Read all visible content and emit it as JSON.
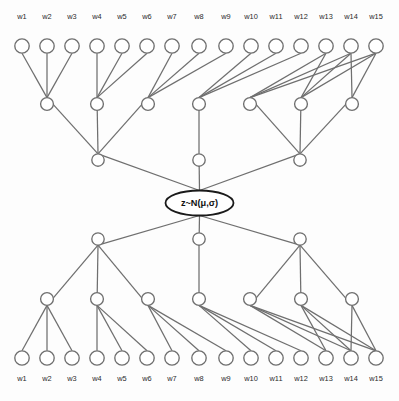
{
  "diagram": {
    "background_color": "#fdfdfd",
    "edge_color": "#6f6f6f",
    "node_stroke_color": "#6f6f6f",
    "node_fill_color": "#ffffff",
    "latent_stroke_color": "#1a1a1a",
    "label_color": "#2b2b2b"
  },
  "latent": {
    "label": "z~N(μ,σ)",
    "cx": 199.5,
    "cy": 203,
    "rx": 34,
    "ry": 12.5
  },
  "leaf_labels": [
    "w1",
    "w2",
    "w3",
    "w4",
    "w5",
    "w6",
    "w7",
    "w8",
    "w9",
    "w10",
    "w11",
    "w12",
    "w13",
    "w14",
    "w15"
  ],
  "geometry": {
    "leaf_x": [
      22,
      47,
      72,
      97,
      122,
      147,
      172,
      199,
      226,
      251,
      276,
      301,
      326,
      351,
      376
    ],
    "leaf_radius": 7.2,
    "mid_radius": 6.4,
    "upper_radius": 6.2,
    "layer2_x": [
      47,
      97,
      148,
      199,
      250,
      301,
      352
    ],
    "layer3_x": [
      98,
      199,
      300
    ],
    "top": {
      "leaf_y": 46,
      "layer2_y": 104,
      "layer3_y": 160,
      "label_y": 19
    },
    "bottom": {
      "leaf_y": 358,
      "layer2_y": 299,
      "layer3_y": 239,
      "label_y": 381
    }
  },
  "structure": {
    "leaf_to_layer2": [
      0,
      0,
      0,
      1,
      1,
      1,
      2,
      2,
      2,
      3,
      3,
      3,
      4,
      4,
      4
    ],
    "layer2_extra": [
      5,
      6
    ],
    "layer2_to_layer3": [
      0,
      0,
      0,
      1,
      2,
      2,
      2
    ],
    "layer3_to_latent": [
      0,
      1,
      2
    ]
  }
}
